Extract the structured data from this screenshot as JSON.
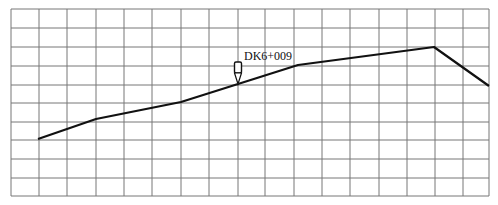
{
  "diagram": {
    "type": "profile-grid",
    "grid": {
      "x_lines": [
        11,
        39,
        67,
        96,
        124,
        152,
        181,
        209,
        238,
        265,
        294,
        322,
        350,
        379,
        407,
        435,
        463,
        489
      ],
      "y_lines": [
        9,
        28,
        47,
        66,
        85,
        103,
        122,
        140,
        159,
        178,
        196
      ],
      "line_color": "#777777"
    },
    "profile_line": {
      "color": "#111111",
      "points": [
        [
          38,
          139
        ],
        [
          96,
          119
        ],
        [
          181,
          102
        ],
        [
          238,
          84
        ],
        [
          298,
          65
        ],
        [
          434,
          47
        ],
        [
          489,
          86
        ]
      ]
    },
    "marker": {
      "label": "DK6+009",
      "x": 238,
      "y": 84
    }
  }
}
